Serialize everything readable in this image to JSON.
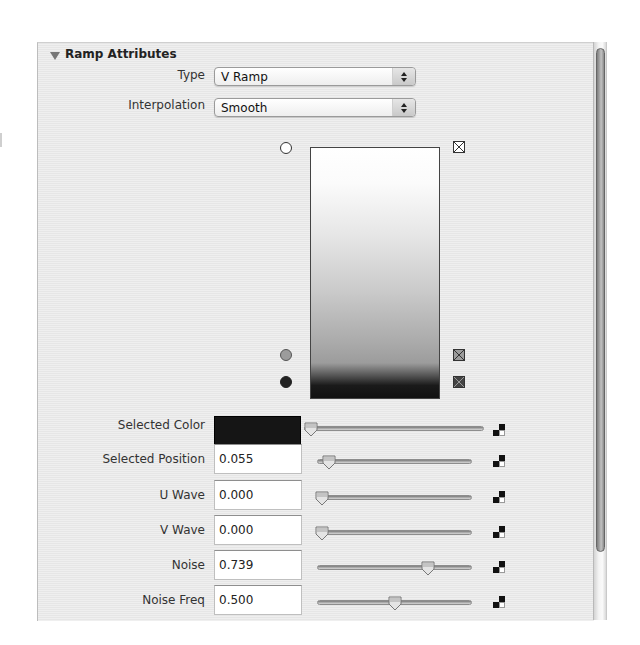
{
  "section": {
    "title": "Ramp Attributes",
    "expanded": true
  },
  "type_field": {
    "label": "Type",
    "value": "V Ramp"
  },
  "interpolation_field": {
    "label": "Interpolation",
    "value": "Smooth"
  },
  "ramp": {
    "handles": [
      {
        "position": 1.0,
        "color": "#ffffff",
        "selected": false
      },
      {
        "position": 0.16,
        "color": "#9c9c9c",
        "selected": false
      },
      {
        "position": 0.055,
        "color": "#151515",
        "selected": true
      }
    ],
    "delete_icon": "x-box-icon"
  },
  "attributes": [
    {
      "label": "Selected Color",
      "value": "",
      "color": "#151515",
      "slider": 0.0
    },
    {
      "label": "Selected Position",
      "value": "0.055",
      "slider": 0.055
    },
    {
      "label": "U Wave",
      "value": "0.000",
      "slider": 0.0
    },
    {
      "label": "V Wave",
      "value": "0.000",
      "slider": 0.0
    },
    {
      "label": "Noise",
      "value": "0.739",
      "slider": 0.739
    },
    {
      "label": "Noise Freq",
      "value": "0.500",
      "slider": 0.5
    }
  ],
  "map_button_icon": "checker-map-icon"
}
